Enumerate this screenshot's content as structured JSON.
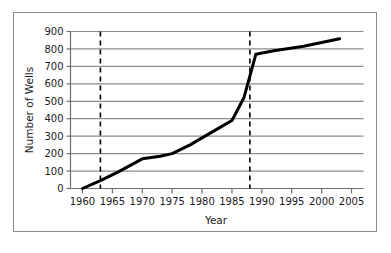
{
  "chart_data": {
    "type": "line",
    "title": "",
    "xlabel": "Year",
    "ylabel": "Number of Wells",
    "xlim": [
      1958,
      2007
    ],
    "ylim": [
      0,
      900
    ],
    "grid": "horizontal",
    "legend": "none",
    "x_ticks": [
      1960,
      1965,
      1970,
      1975,
      1980,
      1985,
      1990,
      1995,
      2000,
      2005
    ],
    "x_tick_labels": [
      "1960",
      "1965",
      "1970",
      "1975",
      "1980",
      "1985",
      "1990",
      "1995",
      "2000",
      "2005"
    ],
    "y_ticks": [
      0,
      100,
      200,
      300,
      400,
      500,
      600,
      700,
      800,
      900
    ],
    "y_tick_labels": [
      "0",
      "100",
      "200",
      "300",
      "400",
      "500",
      "600",
      "700",
      "800",
      "900"
    ],
    "series": [
      {
        "name": "Number of Wells",
        "color": "#000000",
        "line_width": 3,
        "x": [
          1960,
          1963,
          1966,
          1970,
          1973,
          1975,
          1978,
          1981,
          1985,
          1987,
          1989,
          1992,
          1997,
          2003
        ],
        "values": [
          0,
          45,
          95,
          170,
          185,
          200,
          250,
          310,
          390,
          520,
          770,
          790,
          815,
          858
        ]
      }
    ],
    "annotations": [
      {
        "type": "vertical-dashed-line",
        "name": "marker-1963",
        "x": 1963,
        "color": "#000000",
        "dash": "5,4"
      },
      {
        "type": "vertical-dashed-line",
        "name": "marker-1988",
        "x": 1988,
        "color": "#000000",
        "dash": "5,4"
      }
    ],
    "colors": {
      "line": "#000000",
      "grid": "#8c8c8c",
      "axis": "#6e6e6e",
      "frame": "#8a8a8a",
      "text": "#1a1a1a",
      "background": "#ffffff"
    }
  }
}
